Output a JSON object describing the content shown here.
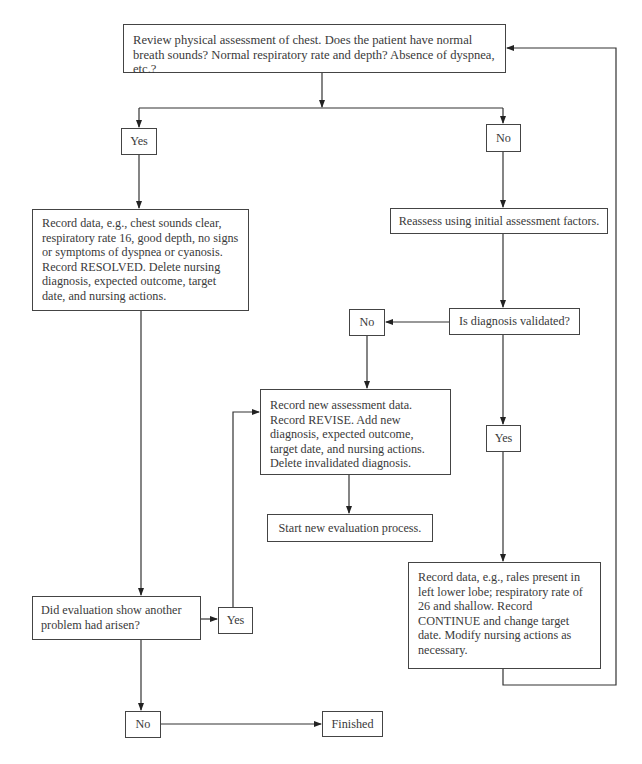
{
  "flowchart": {
    "start": "Review physical assessment of chest. Does the patient have normal breath sounds? Normal respiratory rate and depth? Absence of dyspnea, etc.?",
    "yes_1": "Yes",
    "no_1": "No",
    "resolved": "Record data, e.g., chest sounds clear, respiratory rate 16, good depth, no signs or symptoms of dyspnea or cyanosis. Record RESOLVED. Delete nursing diagnosis, expected outcome, target date, and nursing actions.",
    "reassess": "Reassess using initial assessment factors.",
    "validated_question": "Is diagnosis validated?",
    "no_2": "No",
    "revise": "Record new assessment data. Record REVISE. Add new diagnosis, expected outcome, target date, and nursing actions. Delete invalidated diagnosis.",
    "start_new": "Start new evaluation process.",
    "yes_2": "Yes",
    "continue": "Record data, e.g., rales present in left lower lobe; respiratory rate of 26 and shallow. Record CONTINUE and change target date. Modify nursing actions as necessary.",
    "another_problem_question": "Did evaluation show another problem had arisen?",
    "yes_3": "Yes",
    "no_3": "No",
    "finished": "Finished"
  }
}
